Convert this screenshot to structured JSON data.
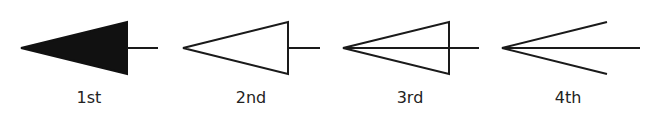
{
  "figure": {
    "stroke_color": "#1a1a1a",
    "items": [
      {
        "label": "1st",
        "style": "filled-triangle",
        "icon": "filled-triangle-arrow-icon"
      },
      {
        "label": "2nd",
        "style": "hollow-triangle",
        "icon": "hollow-triangle-arrow-icon"
      },
      {
        "label": "3rd",
        "style": "hollow-triangle-with-line",
        "icon": "hollow-triangle-line-arrow-icon"
      },
      {
        "label": "4th",
        "style": "open-arrow",
        "icon": "open-arrow-icon"
      }
    ]
  }
}
